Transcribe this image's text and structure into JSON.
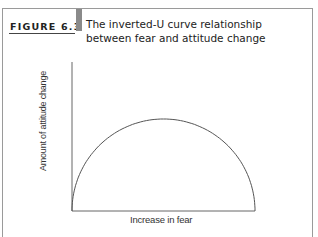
{
  "figure": {
    "label": "FIGURE 6.3",
    "title_line1": "The inverted-U curve relationship",
    "title_line2": "between fear and attitude change"
  },
  "chart_data": {
    "type": "line",
    "title": "The inverted-U curve relationship between fear and attitude change",
    "xlabel": "Increase in fear",
    "ylabel": "Amount of attitude change",
    "series": [
      {
        "name": "Attitude change",
        "shape": "inverted-U (semi-elliptical arc)",
        "x": [
          0,
          0.1,
          0.2,
          0.3,
          0.4,
          0.5,
          0.6,
          0.7,
          0.8,
          0.9,
          1.0
        ],
        "values": [
          0,
          0.6,
          0.8,
          0.92,
          0.98,
          1.0,
          0.98,
          0.92,
          0.8,
          0.6,
          0
        ]
      }
    ],
    "xlim": [
      0,
      1
    ],
    "ylim": [
      0,
      1.6
    ],
    "grid": false,
    "ticks": "none",
    "legend": "none"
  },
  "colors": {
    "frame": "#9a9a9a",
    "text": "#222222",
    "accent_bar": "#8a8a8a",
    "curve": "#555555"
  }
}
